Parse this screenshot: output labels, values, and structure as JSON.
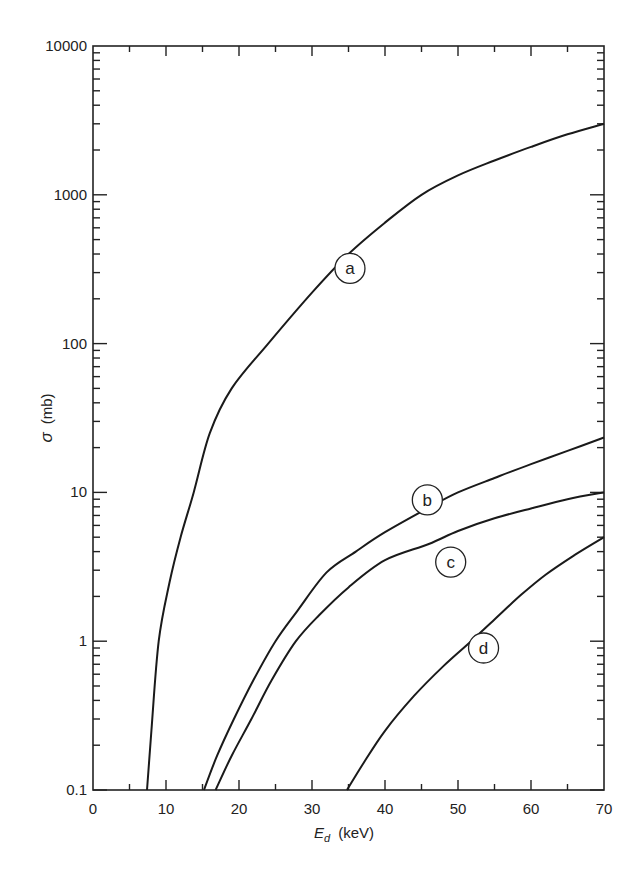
{
  "chart_data": {
    "type": "line",
    "title": "",
    "xlabel": "E_d (keV)",
    "xlabel_main": "E",
    "xlabel_sub": "d",
    "xlabel_unit": "(keV)",
    "ylabel": "σ (mb)",
    "ylabel_symbol": "σ",
    "ylabel_unit": "(mb)",
    "xlim": [
      0,
      70
    ],
    "ylim": [
      0.1,
      10000
    ],
    "yscale": "log",
    "grid": false,
    "legend": "none (curves labelled in circles a, b, c, d)",
    "x_ticks": [
      "0",
      "10",
      "20",
      "30",
      "40",
      "50",
      "60",
      "70"
    ],
    "y_ticks": [
      "0.1",
      "1",
      "10",
      "100",
      "1000",
      "10000"
    ],
    "series": [
      {
        "name": "a",
        "x": [
          7.4,
          8.0,
          9.0,
          10.5,
          12.0,
          13.8,
          16.0,
          19.0,
          24.0,
          30.0,
          35.0,
          40.0,
          45.0,
          50.0,
          55.0,
          60.0,
          65.0,
          70.0
        ],
        "values": [
          0.1,
          0.25,
          1.0,
          2.5,
          5.0,
          10,
          25,
          50,
          100,
          220,
          400,
          650,
          1000,
          1350,
          1700,
          2100,
          2550,
          3000
        ],
        "label_pos": {
          "x": 35.2,
          "y": 320
        }
      },
      {
        "name": "b",
        "x": [
          15.2,
          17.0,
          19.3,
          22.0,
          25.0,
          28.0,
          32.0,
          36.0,
          40.0,
          46.0,
          50.0,
          55.0,
          60.0,
          65.0,
          70.0
        ],
        "values": [
          0.1,
          0.17,
          0.3,
          0.55,
          1.0,
          1.6,
          2.9,
          4.0,
          5.4,
          7.9,
          10,
          12.5,
          15.5,
          19,
          23.4
        ],
        "label_pos": {
          "x": 45.8,
          "y": 8.9
        }
      },
      {
        "name": "c",
        "x": [
          16.8,
          19.0,
          21.7,
          24.5,
          27.8,
          31.0,
          35.0,
          40.0,
          46.0,
          50.0,
          55.0,
          60.0,
          65.0,
          70.0
        ],
        "values": [
          0.1,
          0.17,
          0.3,
          0.55,
          1.0,
          1.5,
          2.3,
          3.5,
          4.5,
          5.5,
          6.7,
          7.8,
          9.0,
          10.0
        ],
        "label_pos": {
          "x": 49.0,
          "y": 3.4
        }
      },
      {
        "name": "d",
        "x": [
          34.8,
          37.0,
          40.0,
          44.0,
          48.0,
          51.8,
          55.0,
          58.6,
          62.0,
          66.0,
          70.0
        ],
        "values": [
          0.1,
          0.15,
          0.25,
          0.43,
          0.68,
          1.0,
          1.4,
          2.04,
          2.8,
          3.8,
          5.0
        ],
        "label_pos": {
          "x": 53.5,
          "y": 0.9
        }
      }
    ]
  }
}
